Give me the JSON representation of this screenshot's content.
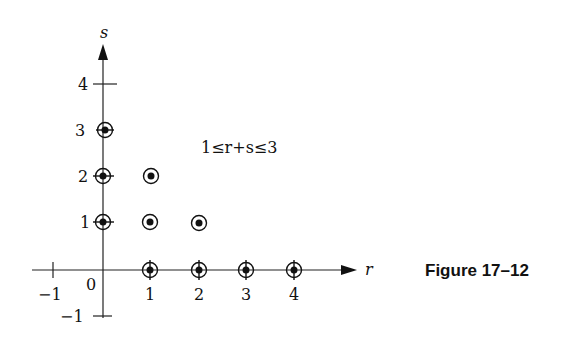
{
  "figure": {
    "caption": "Figure 17–12",
    "region_label": "1≤r+s≤3",
    "x_axis_label": "r",
    "y_axis_label": "s",
    "origin_label": "0"
  },
  "axes": {
    "x_ticks": [
      "−1",
      "1",
      "2",
      "3",
      "4"
    ],
    "y_ticks": [
      "4",
      "3",
      "2",
      "1",
      "−1"
    ]
  },
  "points": [
    {
      "r": 0,
      "s": 3
    },
    {
      "r": 0,
      "s": 2
    },
    {
      "r": 1,
      "s": 2
    },
    {
      "r": 0,
      "s": 1
    },
    {
      "r": 1,
      "s": 1
    },
    {
      "r": 2,
      "s": 1
    },
    {
      "r": 1,
      "s": 0
    },
    {
      "r": 2,
      "s": 0
    },
    {
      "r": 3,
      "s": 0
    },
    {
      "r": 4,
      "s": 0
    }
  ],
  "colors": {
    "ink": "#111111",
    "background": "#ffffff"
  }
}
